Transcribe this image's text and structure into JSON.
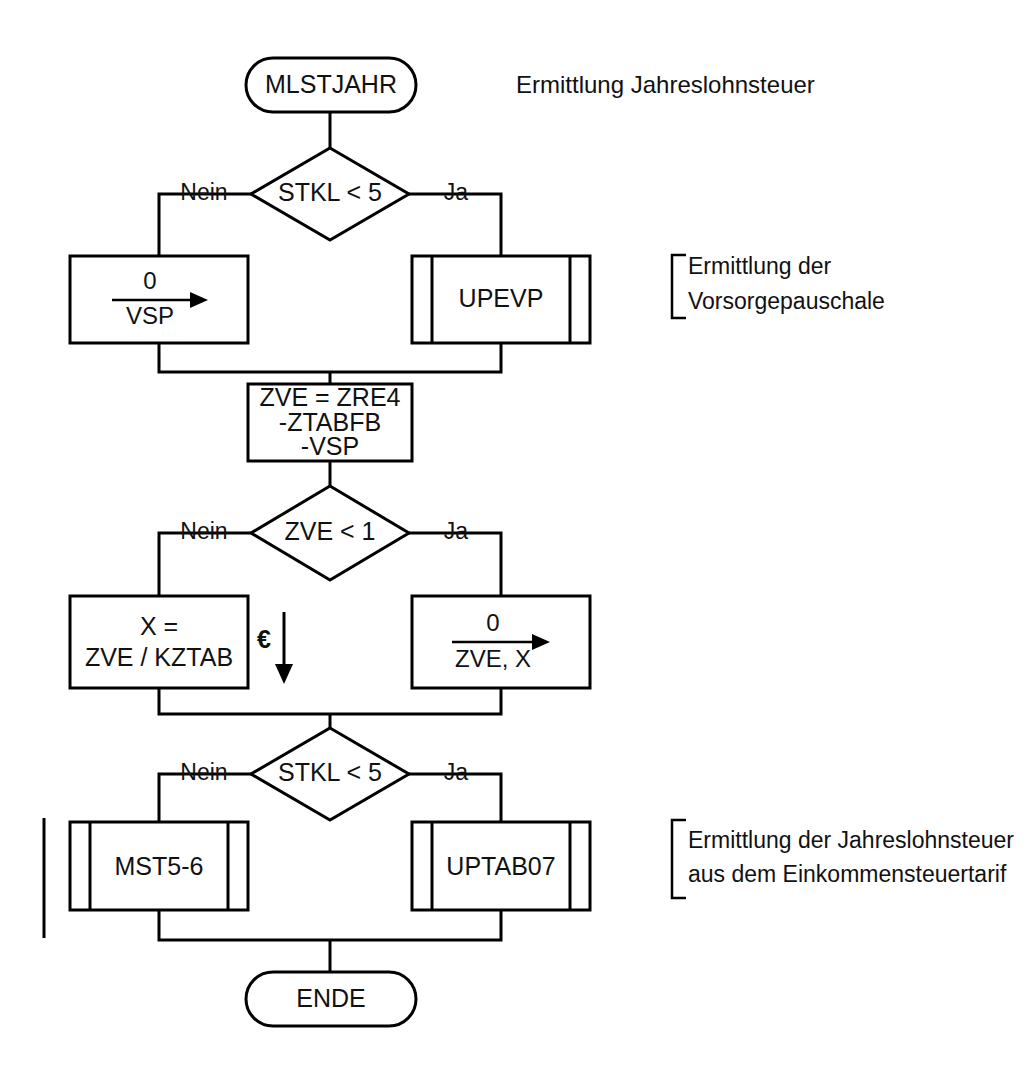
{
  "diagram": {
    "title": "Ermittlung Jahreslohnsteuer",
    "language": "de",
    "type": "flowchart"
  },
  "nodes": {
    "start": {
      "label": "MLSTJAHR",
      "shape": "terminator"
    },
    "decision1": {
      "label": "STKL < 5",
      "shape": "decision"
    },
    "assign_vsp": {
      "numerator": "0",
      "denominator": "VSP",
      "shape": "process-assign"
    },
    "upevp": {
      "label": "UPEVP",
      "shape": "predefined-process"
    },
    "zve_calc": {
      "line1": "ZVE = ZRE4",
      "line2": "-ZTABFB",
      "line3": "-VSP",
      "shape": "process"
    },
    "decision2": {
      "label": "ZVE < 1",
      "shape": "decision"
    },
    "x_calc": {
      "line1": "X =",
      "line2": "ZVE / KZTAB",
      "shape": "process"
    },
    "assign_zvex": {
      "numerator": "0",
      "denominator": "ZVE, X",
      "shape": "process-assign"
    },
    "decision3": {
      "label": "STKL < 5",
      "shape": "decision"
    },
    "mst56": {
      "label": "MST5-6",
      "shape": "predefined-process"
    },
    "uptab07": {
      "label": "UPTAB07",
      "shape": "predefined-process"
    },
    "end": {
      "label": "ENDE",
      "shape": "terminator"
    }
  },
  "branch_labels": {
    "d1_no": "Nein",
    "d1_yes": "Ja",
    "d2_no": "Nein",
    "d2_yes": "Ja",
    "d3_no": "Nein",
    "d3_yes": "Ja"
  },
  "annotations": {
    "euro_marker": "€",
    "note_vorsorge": {
      "line1": "Ermittlung der",
      "line2": "Vorsorgepauschale"
    },
    "note_tarif": {
      "line1": "Ermittlung der Jahreslohnsteuer",
      "line2": "aus dem Einkommensteuertarif"
    }
  },
  "colors": {
    "stroke": "#000000",
    "fill": "#ffffff",
    "text": "#111111"
  }
}
